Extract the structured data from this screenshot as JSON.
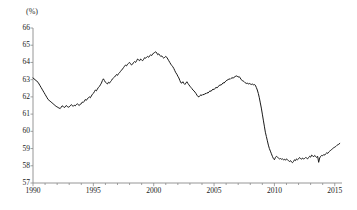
{
  "chart_data": {
    "type": "line",
    "title": "",
    "subtitle": "",
    "xlabel": "",
    "ylabel": "",
    "unit_label": "(%)",
    "ylim": [
      57,
      66
    ],
    "xlim": [
      1990.0,
      2015.6
    ],
    "grid": false,
    "legend": null,
    "y_ticks": [
      57,
      58,
      59,
      60,
      61,
      62,
      63,
      64,
      65,
      66
    ],
    "y_tick_labels": [
      "57",
      "58",
      "59",
      "60",
      "61",
      "62",
      "63",
      "64",
      "65",
      "66"
    ],
    "x_ticks": [
      1990,
      1995,
      2000,
      2005,
      2010,
      2015
    ],
    "x_tick_labels": [
      "1990",
      "1995",
      "2000",
      "2005",
      "2010",
      "2015"
    ],
    "x_minor_tick_interval": 1,
    "line_color": "#1a1a1a",
    "line_width": 1.0,
    "axis_color": "#8a8a8a",
    "series": [
      {
        "name": "ratio",
        "x": [
          1990.0,
          1990.083,
          1990.167,
          1990.25,
          1990.333,
          1990.417,
          1990.5,
          1990.583,
          1990.667,
          1990.75,
          1990.833,
          1990.917,
          1991.0,
          1991.083,
          1991.167,
          1991.25,
          1991.333,
          1991.417,
          1991.5,
          1991.583,
          1991.667,
          1991.75,
          1991.833,
          1991.917,
          1992.0,
          1992.083,
          1992.167,
          1992.25,
          1992.333,
          1992.417,
          1992.5,
          1992.583,
          1992.667,
          1992.75,
          1992.833,
          1992.917,
          1993.0,
          1993.083,
          1993.167,
          1993.25,
          1993.333,
          1993.417,
          1993.5,
          1993.583,
          1993.667,
          1993.75,
          1993.833,
          1993.917,
          1994.0,
          1994.083,
          1994.167,
          1994.25,
          1994.333,
          1994.417,
          1994.5,
          1994.583,
          1994.667,
          1994.75,
          1994.833,
          1994.917,
          1995.0,
          1995.083,
          1995.167,
          1995.25,
          1995.333,
          1995.417,
          1995.5,
          1995.583,
          1995.667,
          1995.75,
          1995.833,
          1995.917,
          1996.0,
          1996.083,
          1996.167,
          1996.25,
          1996.333,
          1996.417,
          1996.5,
          1996.583,
          1996.667,
          1996.75,
          1996.833,
          1996.917,
          1997.0,
          1997.083,
          1997.167,
          1997.25,
          1997.333,
          1997.417,
          1997.5,
          1997.583,
          1997.667,
          1997.75,
          1997.833,
          1997.917,
          1998.0,
          1998.083,
          1998.167,
          1998.25,
          1998.333,
          1998.417,
          1998.5,
          1998.583,
          1998.667,
          1998.75,
          1998.833,
          1998.917,
          1999.0,
          1999.083,
          1999.167,
          1999.25,
          1999.333,
          1999.417,
          1999.5,
          1999.583,
          1999.667,
          1999.75,
          1999.833,
          1999.917,
          2000.0,
          2000.083,
          2000.167,
          2000.25,
          2000.333,
          2000.417,
          2000.5,
          2000.583,
          2000.667,
          2000.75,
          2000.833,
          2000.917,
          2001.0,
          2001.083,
          2001.167,
          2001.25,
          2001.333,
          2001.417,
          2001.5,
          2001.583,
          2001.667,
          2001.75,
          2001.833,
          2001.917,
          2002.0,
          2002.083,
          2002.167,
          2002.25,
          2002.333,
          2002.417,
          2002.5,
          2002.583,
          2002.667,
          2002.75,
          2002.833,
          2002.917,
          2003.0,
          2003.083,
          2003.167,
          2003.25,
          2003.333,
          2003.417,
          2003.5,
          2003.583,
          2003.667,
          2003.75,
          2003.833,
          2003.917,
          2004.0,
          2004.083,
          2004.167,
          2004.25,
          2004.333,
          2004.417,
          2004.5,
          2004.583,
          2004.667,
          2004.75,
          2004.833,
          2004.917,
          2005.0,
          2005.083,
          2005.167,
          2005.25,
          2005.333,
          2005.417,
          2005.5,
          2005.583,
          2005.667,
          2005.75,
          2005.833,
          2005.917,
          2006.0,
          2006.083,
          2006.167,
          2006.25,
          2006.333,
          2006.417,
          2006.5,
          2006.583,
          2006.667,
          2006.75,
          2006.833,
          2006.917,
          2007.0,
          2007.083,
          2007.167,
          2007.25,
          2007.333,
          2007.417,
          2007.5,
          2007.583,
          2007.667,
          2007.75,
          2007.833,
          2007.917,
          2008.0,
          2008.083,
          2008.167,
          2008.25,
          2008.333,
          2008.417,
          2008.5,
          2008.583,
          2008.667,
          2008.75,
          2008.833,
          2008.917,
          2009.0,
          2009.083,
          2009.167,
          2009.25,
          2009.333,
          2009.417,
          2009.5,
          2009.583,
          2009.667,
          2009.75,
          2009.833,
          2009.917,
          2010.0,
          2010.083,
          2010.167,
          2010.25,
          2010.333,
          2010.417,
          2010.5,
          2010.583,
          2010.667,
          2010.75,
          2010.833,
          2010.917,
          2011.0,
          2011.083,
          2011.167,
          2011.25,
          2011.333,
          2011.417,
          2011.5,
          2011.583,
          2011.667,
          2011.75,
          2011.833,
          2011.917,
          2012.0,
          2012.083,
          2012.167,
          2012.25,
          2012.333,
          2012.417,
          2012.5,
          2012.583,
          2012.667,
          2012.75,
          2012.833,
          2012.917,
          2013.0,
          2013.083,
          2013.167,
          2013.25,
          2013.333,
          2013.417,
          2013.5,
          2013.583,
          2013.667,
          2013.75,
          2013.833,
          2013.917,
          2014.0,
          2014.083,
          2014.167,
          2014.25,
          2014.333,
          2014.417,
          2014.5,
          2014.583,
          2014.667,
          2014.75,
          2014.833,
          2014.917,
          2015.0,
          2015.083,
          2015.167,
          2015.25,
          2015.333,
          2015.417
        ],
        "values": [
          63.1,
          63.05,
          63.0,
          62.95,
          62.9,
          62.85,
          62.75,
          62.65,
          62.55,
          62.45,
          62.35,
          62.25,
          62.15,
          62.05,
          61.95,
          61.85,
          61.8,
          61.75,
          61.7,
          61.65,
          61.6,
          61.55,
          61.5,
          61.45,
          61.42,
          61.38,
          61.35,
          61.32,
          61.4,
          61.48,
          61.45,
          61.38,
          61.42,
          61.5,
          61.45,
          61.4,
          61.42,
          61.48,
          61.55,
          61.5,
          61.45,
          61.52,
          61.48,
          61.55,
          61.6,
          61.55,
          61.5,
          61.58,
          61.6,
          61.7,
          61.68,
          61.75,
          61.85,
          61.8,
          61.88,
          61.95,
          62.0,
          61.95,
          62.05,
          62.15,
          62.2,
          62.3,
          62.4,
          62.35,
          62.45,
          62.55,
          62.6,
          62.7,
          62.8,
          62.95,
          63.05,
          62.95,
          62.85,
          62.8,
          62.75,
          62.85,
          62.8,
          62.88,
          62.95,
          63.05,
          63.1,
          63.15,
          63.22,
          63.3,
          63.25,
          63.35,
          63.4,
          63.48,
          63.55,
          63.62,
          63.7,
          63.78,
          63.85,
          63.8,
          63.9,
          63.95,
          64.0,
          63.92,
          63.85,
          63.9,
          64.0,
          64.05,
          64.0,
          64.1,
          64.2,
          64.15,
          64.1,
          64.2,
          64.15,
          64.1,
          64.18,
          64.28,
          64.25,
          64.3,
          64.35,
          64.3,
          64.38,
          64.45,
          64.4,
          64.48,
          64.55,
          64.58,
          64.62,
          64.55,
          64.45,
          64.5,
          64.42,
          64.35,
          64.38,
          64.3,
          64.25,
          64.3,
          64.35,
          64.3,
          64.2,
          64.1,
          64.0,
          63.9,
          63.82,
          63.75,
          63.65,
          63.52,
          63.4,
          63.32,
          63.2,
          63.1,
          62.95,
          62.82,
          62.8,
          62.88,
          62.78,
          62.72,
          62.8,
          62.88,
          62.78,
          62.7,
          62.62,
          62.55,
          62.48,
          62.4,
          62.35,
          62.28,
          62.2,
          62.1,
          62.02,
          62.0,
          62.08,
          62.12,
          62.08,
          62.15,
          62.12,
          62.2,
          62.18,
          62.25,
          62.22,
          62.3,
          62.35,
          62.32,
          62.4,
          62.45,
          62.42,
          62.5,
          62.55,
          62.52,
          62.6,
          62.65,
          62.7,
          62.68,
          62.75,
          62.82,
          62.8,
          62.88,
          62.92,
          62.98,
          63.0,
          63.05,
          63.02,
          63.08,
          63.12,
          63.08,
          63.15,
          63.18,
          63.22,
          63.2,
          63.15,
          63.18,
          63.1,
          63.0,
          62.95,
          62.92,
          62.88,
          62.82,
          62.78,
          62.8,
          62.75,
          62.78,
          62.75,
          62.72,
          62.75,
          62.7,
          62.72,
          62.68,
          62.55,
          62.4,
          62.2,
          61.95,
          61.65,
          61.35,
          61.0,
          60.65,
          60.3,
          59.95,
          59.7,
          59.45,
          59.2,
          59.0,
          58.85,
          58.7,
          58.55,
          58.42,
          58.35,
          58.48,
          58.55,
          58.5,
          58.45,
          58.4,
          58.42,
          58.38,
          58.4,
          58.35,
          58.38,
          58.32,
          58.4,
          58.35,
          58.3,
          58.25,
          58.3,
          58.22,
          58.18,
          58.25,
          58.35,
          58.3,
          58.4,
          58.35,
          58.4,
          58.48,
          58.42,
          58.38,
          58.45,
          58.4,
          58.42,
          58.48,
          58.45,
          58.4,
          58.48,
          58.55,
          58.5,
          58.62,
          58.58,
          58.52,
          58.6,
          58.55,
          58.48,
          58.55,
          58.2,
          58.45,
          58.55,
          58.6,
          58.58,
          58.65,
          58.62,
          58.7,
          58.75,
          58.72,
          58.8,
          58.85,
          58.9,
          58.95,
          59.0,
          59.05,
          59.08,
          59.12,
          59.18,
          59.22,
          59.25,
          59.3
        ]
      }
    ]
  },
  "axis_unit": "(%)"
}
